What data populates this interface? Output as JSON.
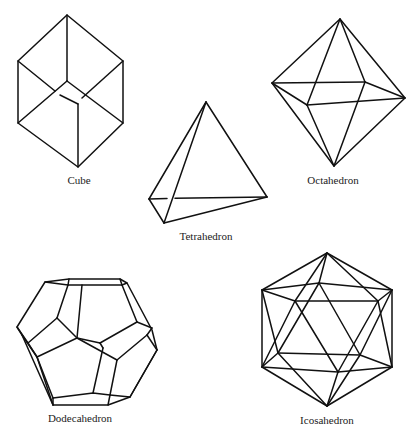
{
  "figure": {
    "solids": [
      {
        "id": "cube",
        "label": "Cube",
        "label_pos": [
          79,
          174
        ]
      },
      {
        "id": "octahedron",
        "label": "Octahedron",
        "label_pos": [
          333,
          174
        ]
      },
      {
        "id": "tetrahedron",
        "label": "Tetrahedron",
        "label_pos": [
          206,
          230
        ]
      },
      {
        "id": "dodecahedron",
        "label": "Dodecahedron",
        "label_pos": [
          80,
          412
        ]
      },
      {
        "id": "icosahedron",
        "label": "Icosahedron",
        "label_pos": [
          327,
          414
        ]
      }
    ],
    "colors": {
      "line": "#111111",
      "background": "#ffffff",
      "text": "#222222"
    }
  }
}
